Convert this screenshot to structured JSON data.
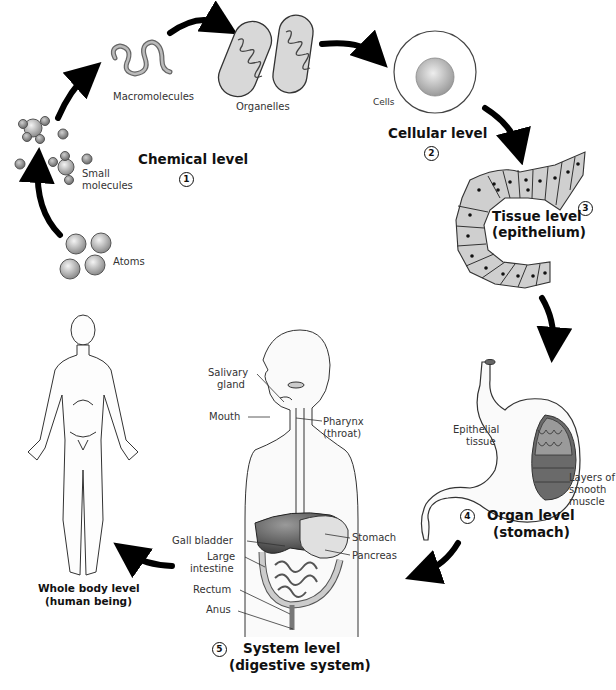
{
  "diagram": {
    "type": "levels-of-organization",
    "levels": [
      {
        "number": "1",
        "title": "Chemical level",
        "subtitle": ""
      },
      {
        "number": "2",
        "title": "Cellular level",
        "subtitle": ""
      },
      {
        "number": "3",
        "title": "Tissue level",
        "subtitle": "(epithelium)"
      },
      {
        "number": "4",
        "title": "Organ level",
        "subtitle": "(stomach)"
      },
      {
        "number": "5",
        "title": "System level",
        "subtitle": "(digestive system)"
      },
      {
        "number": "",
        "title": "Whole body level",
        "subtitle": "(human being)"
      }
    ],
    "chemical_labels": {
      "atoms": "Atoms",
      "small_molecules_1": "Small",
      "small_molecules_2": "molecules",
      "macromolecules": "Macromolecules",
      "organelles": "Organelles"
    },
    "cell_label": "Cells",
    "organ_labels": {
      "epithelial_1": "Epithelial",
      "epithelial_2": "tissue",
      "muscle_1": "Layers of",
      "muscle_2": "smooth",
      "muscle_3": "muscle"
    },
    "system_labels": {
      "salivary_1": "Salivary",
      "salivary_2": "gland",
      "mouth": "Mouth",
      "pharynx_1": "Pharynx",
      "pharynx_2": "(throat)",
      "gall_bladder": "Gall bladder",
      "large_intestine_1": "Large",
      "large_intestine_2": "intestine",
      "rectum": "Rectum",
      "anus": "Anus",
      "stomach": "Stomach",
      "pancreas": "Pancreas"
    },
    "colors": {
      "arrow": "#000000",
      "sphere": "#b8b8b8",
      "tissue": "#cfcfcf",
      "liver": "#5a5a5a",
      "outline": "#333333"
    }
  }
}
